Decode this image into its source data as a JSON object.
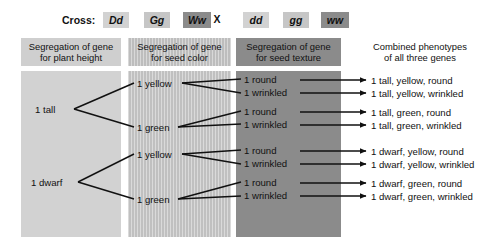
{
  "cross_row": {
    "label": "Cross:",
    "parent1": [
      {
        "text": "Dd",
        "shade": "light"
      },
      {
        "text": "Gg",
        "shade": "mid"
      },
      {
        "text": "Ww",
        "shade": "dark"
      }
    ],
    "operator": "X",
    "parent2": [
      {
        "text": "dd",
        "shade": "light"
      },
      {
        "text": "gg",
        "shade": "mid"
      },
      {
        "text": "ww",
        "shade": "dark"
      }
    ]
  },
  "headers": [
    {
      "line1": "Segregation of gene",
      "line2": "for plant height"
    },
    {
      "line1": "Segregation of gene",
      "line2": "for seed color"
    },
    {
      "line1": "Segregation of gene",
      "line2": "for seed texture"
    },
    {
      "line1": "Combined phenotypes",
      "line2": "of all three genes"
    }
  ],
  "height_nodes": [
    {
      "label": "1 tall"
    },
    {
      "label": "1 dwarf"
    }
  ],
  "color_nodes": [
    {
      "label": "1 yellow"
    },
    {
      "label": "1 green"
    },
    {
      "label": "1 yellow"
    },
    {
      "label": "1 green"
    }
  ],
  "texture_nodes": [
    {
      "label": "1 round"
    },
    {
      "label": "1 wrinkled"
    },
    {
      "label": "1 round"
    },
    {
      "label": "1 wrinkled"
    },
    {
      "label": "1 round"
    },
    {
      "label": "1 wrinkled"
    },
    {
      "label": "1 round"
    },
    {
      "label": "1 wrinkled"
    }
  ],
  "phenotypes": [
    {
      "label": "1 tall, yellow, round"
    },
    {
      "label": "1 tall, yellow, wrinkled"
    },
    {
      "label": "1 tall, green, round"
    },
    {
      "label": "1 tall, green, wrinkled"
    },
    {
      "label": "1 dwarf, yellow, round"
    },
    {
      "label": "1 dwarf, yellow, wrinkled"
    },
    {
      "label": "1 dwarf, green, round"
    },
    {
      "label": "1 dwarf, green, wrinkled"
    }
  ],
  "colors": {
    "band_height": "#d2d2d2",
    "band_color": "#c6c6c6",
    "band_texture": "#8b8b8b",
    "text": "#111111",
    "background": "#ffffff"
  }
}
